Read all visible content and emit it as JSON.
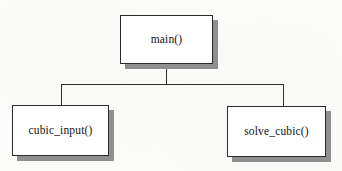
{
  "diagram": {
    "type": "structure-chart",
    "nodes": [
      {
        "id": "main",
        "label": "main()",
        "level": 0,
        "x": 120,
        "y": 15,
        "width": 93,
        "height": 49
      },
      {
        "id": "cubic_input",
        "label": "cubic_input()",
        "level": 1,
        "x": 12,
        "y": 105,
        "width": 97,
        "height": 51
      },
      {
        "id": "solve_cubic",
        "label": "solve_cubic()",
        "level": 1,
        "x": 227,
        "y": 106,
        "width": 99,
        "height": 51
      }
    ],
    "edges": [
      {
        "from": "main",
        "to": "cubic_input",
        "style": "orthogonal"
      },
      {
        "from": "main",
        "to": "solve_cubic",
        "style": "orthogonal"
      }
    ],
    "colors": {
      "background": "#fcfcfa",
      "box_fill": "#ffffff",
      "box_border": "#2b2b2b",
      "shadow": "#9a9a9a",
      "line": "#2e2e2e",
      "text": "#121212"
    }
  }
}
